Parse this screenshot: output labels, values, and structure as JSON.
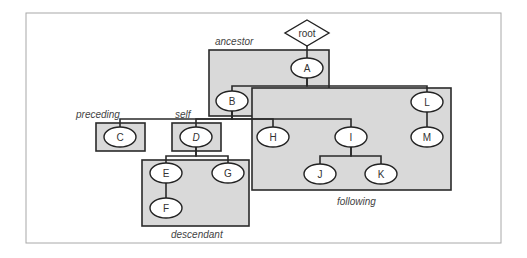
{
  "diagram": {
    "colors": {
      "frame_border": "#a8a8a8",
      "region_fill": "#d9d9d9",
      "region_border": "#2a2a2a",
      "node_fill": "#ffffff",
      "line": "#2a2a2a"
    },
    "frame": {
      "x": 26,
      "y": 13,
      "w": 475,
      "h": 230
    },
    "root": {
      "label": "root",
      "cx": 307,
      "cy": 33,
      "hw": 22,
      "hh": 13
    },
    "regions": [
      {
        "id": "ancestor",
        "label": "ancestor",
        "x": 209,
        "y": 50,
        "w": 120,
        "h": 66,
        "label_x": 215,
        "label_y": 45
      },
      {
        "id": "following",
        "label": "following",
        "x": 252,
        "y": 88,
        "w": 199,
        "h": 102,
        "label_x": 337,
        "label_y": 205
      },
      {
        "id": "preceding",
        "label": "preceding",
        "x": 96,
        "y": 123,
        "w": 49,
        "h": 28,
        "label_x": 76,
        "label_y": 118
      },
      {
        "id": "self",
        "label": "self",
        "x": 172,
        "y": 123,
        "w": 49,
        "h": 28,
        "label_x": 175,
        "label_y": 118
      },
      {
        "id": "descendant",
        "label": "descendant",
        "x": 142,
        "y": 160,
        "w": 107,
        "h": 66,
        "label_x": 171,
        "label_y": 238
      }
    ],
    "nodes": [
      {
        "id": "A",
        "label": "A",
        "cx": 307,
        "cy": 68,
        "italic": false
      },
      {
        "id": "B",
        "label": "B",
        "cx": 232,
        "cy": 101,
        "italic": false
      },
      {
        "id": "L",
        "label": "L",
        "cx": 427,
        "cy": 102,
        "italic": false
      },
      {
        "id": "C",
        "label": "C",
        "cx": 120,
        "cy": 137,
        "italic": false
      },
      {
        "id": "D",
        "label": "D",
        "cx": 196,
        "cy": 137,
        "italic": true
      },
      {
        "id": "H",
        "label": "H",
        "cx": 273,
        "cy": 137,
        "italic": false
      },
      {
        "id": "I",
        "label": "I",
        "cx": 351,
        "cy": 137,
        "italic": false
      },
      {
        "id": "M",
        "label": "M",
        "cx": 427,
        "cy": 137,
        "italic": false
      },
      {
        "id": "E",
        "label": "E",
        "cx": 166,
        "cy": 173,
        "italic": false
      },
      {
        "id": "G",
        "label": "G",
        "cx": 228,
        "cy": 173,
        "italic": false
      },
      {
        "id": "J",
        "label": "J",
        "cx": 320,
        "cy": 174,
        "italic": false
      },
      {
        "id": "K",
        "label": "K",
        "cx": 381,
        "cy": 174,
        "italic": false
      },
      {
        "id": "F",
        "label": "F",
        "cx": 166,
        "cy": 208,
        "italic": false
      }
    ],
    "edges": [
      [
        "root",
        "A"
      ],
      [
        "A",
        "B"
      ],
      [
        "A",
        "L"
      ],
      [
        "B",
        "C"
      ],
      [
        "B",
        "D"
      ],
      [
        "B",
        "H"
      ],
      [
        "B",
        "I"
      ],
      [
        "L",
        "M"
      ],
      [
        "D",
        "E"
      ],
      [
        "D",
        "G"
      ],
      [
        "I",
        "J"
      ],
      [
        "I",
        "K"
      ],
      [
        "E",
        "F"
      ]
    ],
    "bus_y": {
      "A": 86,
      "B": 119,
      "D": 156,
      "I": 156
    },
    "node_rx": 16,
    "node_ry": 10
  }
}
